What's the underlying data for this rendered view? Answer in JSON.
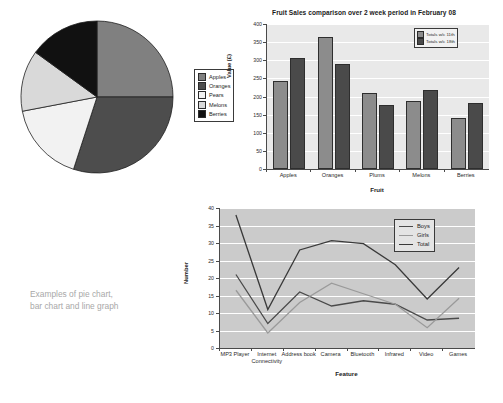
{
  "caption": "Examples of pie chart,\nbar chart and line graph",
  "chart_data": [
    {
      "type": "pie",
      "title": "",
      "legend_position": "right",
      "categories": [
        "Apples",
        "Oranges",
        "Pears",
        "Melons",
        "Berries"
      ],
      "values": [
        25,
        30,
        17,
        13,
        15
      ],
      "unit": "percent",
      "colors": [
        "#808080",
        "#4d4d4d",
        "#f2f2f2",
        "#d9d9d9",
        "#111111"
      ],
      "legend": [
        "Apples",
        "Oranges",
        "Pears",
        "Melons",
        "Berries"
      ]
    },
    {
      "type": "bar",
      "title": "Fruit Sales comparison over 2 week period in February 08",
      "xlabel": "Fruit",
      "ylabel": "Value (£)",
      "categories": [
        "Apples",
        "Oranges",
        "Plums",
        "Melons",
        "Berries"
      ],
      "ylim": [
        0,
        400
      ],
      "yticks": [
        0,
        50,
        100,
        150,
        200,
        250,
        300,
        350,
        400
      ],
      "grid": true,
      "legend_position": "top-right",
      "series": [
        {
          "name": "Totals w/c 11th",
          "values": [
            244,
            363,
            210,
            189,
            142
          ],
          "color": "#8c8c8c"
        },
        {
          "name": "Totals w/c 18th",
          "values": [
            305,
            291,
            176,
            217,
            183
          ],
          "color": "#4a4a4a"
        }
      ]
    },
    {
      "type": "line",
      "title": "",
      "xlabel": "Feature",
      "ylabel": "Number",
      "categories": [
        "MP3 Player",
        "Internet Connectivity",
        "Address book",
        "Camera",
        "Bluetooth",
        "Infrared",
        "Video",
        "Games"
      ],
      "ylim": [
        0,
        40
      ],
      "yticks": [
        0,
        5,
        10,
        15,
        20,
        25,
        30,
        35,
        40
      ],
      "grid": true,
      "legend_position": "top-right",
      "series": [
        {
          "name": "Boys",
          "values": [
            21,
            7,
            16,
            12,
            13.5,
            12.5,
            8,
            8.5
          ],
          "color": "#4a4a4a"
        },
        {
          "name": "Girls",
          "values": [
            16.5,
            4.3,
            13,
            18.5,
            15.5,
            12.5,
            5.8,
            14.2
          ],
          "color": "#9a9a9a"
        },
        {
          "name": "Total",
          "values": [
            38,
            11,
            28,
            30.7,
            29.8,
            23.8,
            14,
            23
          ],
          "color": "#3a3a3a"
        }
      ]
    }
  ]
}
